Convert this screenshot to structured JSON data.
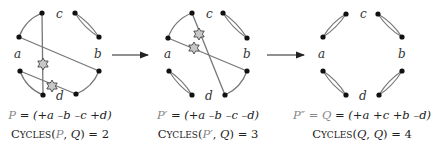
{
  "colors": {
    "edge": "#777777",
    "point": "#111111",
    "star_fill": "#c8c8c8",
    "star_stroke": "#333333",
    "arrow": "#222222",
    "var_gray": "#888888"
  },
  "arrows": [
    {
      "x1": 112,
      "x2": 149,
      "y": 55
    },
    {
      "x1": 267,
      "x2": 305,
      "y": 55
    }
  ],
  "panels": [
    {
      "id": "P",
      "labels": {
        "a": "a",
        "b": "b",
        "c": "c",
        "d": "d"
      },
      "caption": {
        "var": "P",
        "rest": " = (+a –b –c +d)",
        "cycles_prefix": "C",
        "cycles_sc": "YCLES",
        "cycles_args_open": "(",
        "cycles_arg1": "P",
        "cycles_sep": ", ",
        "cycles_arg2": "Q",
        "cycles_close": ") = ",
        "cycles_value": "2"
      }
    },
    {
      "id": "P-prime",
      "labels": {
        "a": "a",
        "b": "b",
        "c": "c",
        "d": "d"
      },
      "caption": {
        "var": "P′",
        "rest": " = (+a –b –c –d)",
        "cycles_prefix": "C",
        "cycles_sc": "YCLES",
        "cycles_args_open": "(",
        "cycles_arg1": "P′",
        "cycles_sep": ", ",
        "cycles_arg2": "Q",
        "cycles_close": ") = ",
        "cycles_value": "3"
      }
    },
    {
      "id": "P-double-prime",
      "labels": {
        "a": "a",
        "b": "b",
        "c": "c",
        "d": "d"
      },
      "caption": {
        "var": "P″ = Q",
        "rest": " = (+a +c +b –d)",
        "cycles_prefix": "C",
        "cycles_sc": "YCLES",
        "cycles_args_open": "(",
        "cycles_arg1": "Q",
        "cycles_sep": ", ",
        "cycles_arg2": "Q",
        "cycles_close": ") = ",
        "cycles_value": "4"
      }
    }
  ]
}
